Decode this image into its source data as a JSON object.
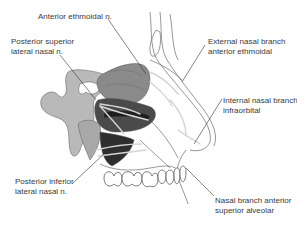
{
  "diagram": {
    "colors": {
      "bone_light": "#b9b9b9",
      "mucosa_mid": "#8a8a8a",
      "mucosa_dark": "#4a4a4a",
      "mucosa_darkest": "#1e1e1e",
      "outline": "#555555",
      "nerve": "#cfcfcf",
      "leader": "#333333"
    },
    "labels": {
      "anterior_ethmoidal": {
        "lines": [
          "Anterior ethmoidal n."
        ]
      },
      "posterior_superior": {
        "lines": [
          "Posterior superior",
          "lateral nasal n."
        ]
      },
      "external_nasal": {
        "lines": [
          "External nasal branch",
          "anterior ethmoidal"
        ]
      },
      "internal_nasal": {
        "lines": [
          "Internal nasal branch",
          "infraorbital"
        ]
      },
      "posterior_inferior": {
        "lines": [
          "Posterior inferior",
          "lateral nasal n."
        ]
      },
      "nasal_branch_asa": {
        "lines": [
          "Nasal branch anterior",
          "superior alveolar"
        ]
      }
    }
  }
}
